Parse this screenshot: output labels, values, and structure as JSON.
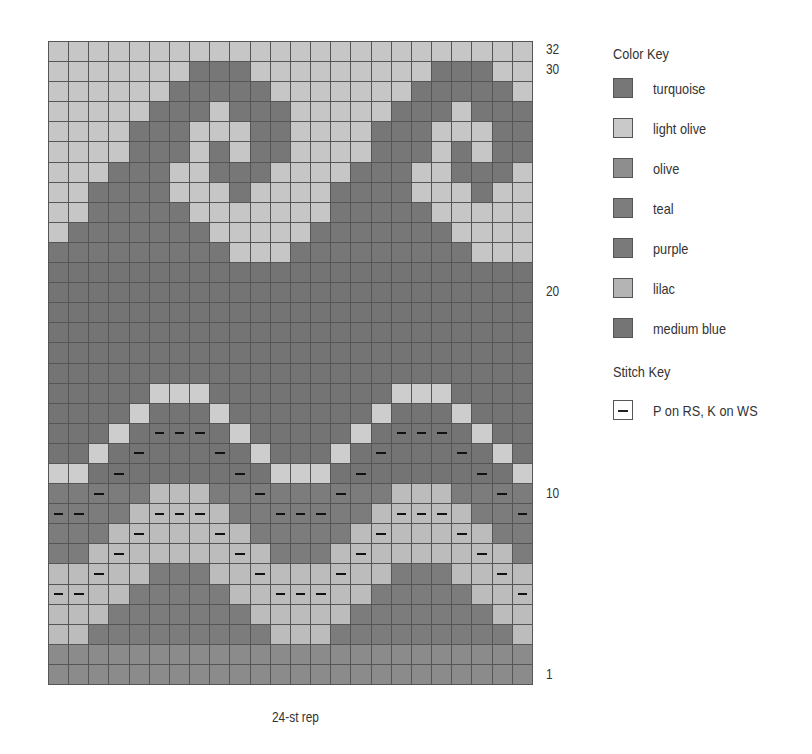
{
  "chart_data": {
    "type": "table",
    "columns": 24,
    "rows": 32,
    "repeat_label": "24-st rep",
    "row_labels": [
      {
        "row": 32,
        "text": "32"
      },
      {
        "row": 30,
        "text": "30"
      },
      {
        "row": 20,
        "text": "20"
      },
      {
        "row": 10,
        "text": "10"
      },
      {
        "row": 1,
        "text": "1"
      }
    ],
    "code_colors": {
      "L": "#c6c6c6",
      "T": "#777777",
      "B": "#747474",
      "C": "#cdcdcd",
      "O": "#bcbcbc",
      "P": "#7c7c7c",
      "M": "#8b8b8b"
    },
    "code_names": {
      "L": "light olive",
      "T": "turquoise",
      "B": "medium blue",
      "C": "lilac",
      "O": "olive",
      "P": "purple",
      "M": "teal"
    },
    "grid_rows_top_to_bottom": [
      {
        "row": 32,
        "cells": "LLLLLLLLLLLLLLLLLLLLLLLL",
        "dashes": "000000000000000000000000"
      },
      {
        "row": 31,
        "cells": "LLLLLLLTTTLLLLLLLLLTTTLL",
        "dashes": "000000000000000000000000"
      },
      {
        "row": 30,
        "cells": "LLLLLLTTTTTLLLLLLLTTTTTL",
        "dashes": "000000000000000000000000"
      },
      {
        "row": 29,
        "cells": "LLLLLTTTLTTTLLLLLTTTLTTT",
        "dashes": "000000000000000000000000"
      },
      {
        "row": 28,
        "cells": "LLLLTTTLLLTTLLLLTTTLLLTT",
        "dashes": "000000000000000000000000"
      },
      {
        "row": 27,
        "cells": "LLLLTTTLTLTTLLLLTTTLTLTT",
        "dashes": "000000000000000000000000"
      },
      {
        "row": 26,
        "cells": "LLLTTTLLTTTLLLLTTTLLTTTL",
        "dashes": "000000000000000000000000"
      },
      {
        "row": 25,
        "cells": "LLTTTTLLLTLLLLTTTTLLLTLL",
        "dashes": "000000000000000000000000"
      },
      {
        "row": 24,
        "cells": "LLTTTTTLLLLLLLTTTTTLLLLL",
        "dashes": "000000000000000000000000"
      },
      {
        "row": 23,
        "cells": "LTTTTTTTLLLLLTTTTTTTLLLL",
        "dashes": "000000000000000000000000"
      },
      {
        "row": 22,
        "cells": "TTTTTTTTTLLLTTTTTTTTTLLL",
        "dashes": "000000000000000000000000"
      },
      {
        "row": 21,
        "cells": "BBBBBBBBBBBBBBBBBBBBBBBB",
        "dashes": "000000000000000000000000"
      },
      {
        "row": 20,
        "cells": "BBBBBBBBBBBBBBBBBBBBBBBB",
        "dashes": "000000000000000000000000"
      },
      {
        "row": 19,
        "cells": "BBBBBBBBBBBBBBBBBBBBBBBB",
        "dashes": "000000000000000000000000"
      },
      {
        "row": 18,
        "cells": "BBBBBBBBBBBBBBBBBBBBBBBB",
        "dashes": "000000000000000000000000"
      },
      {
        "row": 17,
        "cells": "BBBBBBBBBBBBBBBBBBBBBBBB",
        "dashes": "000000000000000000000000"
      },
      {
        "row": 16,
        "cells": "BBBBBBBBBBBBBBBBBBBBBBBB",
        "dashes": "000000000000000000000000"
      },
      {
        "row": 15,
        "cells": "BBBBBCCCBBBBBBBBBCCCBBBB",
        "dashes": "000000000000000000000000"
      },
      {
        "row": 14,
        "cells": "BBBBCBBBCBBBBBBBCBBBCBBB",
        "dashes": "000000000000000000000000"
      },
      {
        "row": 13,
        "cells": "BBBCBBBBBCBBBBBCBBBBBCBB",
        "dashes": "000001110000000001110000"
      },
      {
        "row": 12,
        "cells": "BBCBBBBBBBCBBBCBBBBBBBCB",
        "dashes": "000010001000000010001000"
      },
      {
        "row": 11,
        "cells": "CCBBBBBBBBBCCCBBBBBBBBBC",
        "dashes": "000100000100000100000100"
      },
      {
        "row": 10,
        "cells": "PPPPPOOOPPPPPPPPPOOOPPPP",
        "dashes": "001000000010001000000010"
      },
      {
        "row": 9,
        "cells": "PPPPOOOOOPPPPPPPOOOOOPPP",
        "dashes": "110001110001110001110001"
      },
      {
        "row": 8,
        "cells": "PPPOOOOOOOPPPPPOOOOOOOPP",
        "dashes": "000010001000000010001000"
      },
      {
        "row": 7,
        "cells": "PPOOOOOOOOOPPPOOOOOOOOOP",
        "dashes": "000100000100000100000100"
      },
      {
        "row": 6,
        "cells": "OOOOOPPPOOOOOOOOOPPPOOOO",
        "dashes": "001000000010001000000010"
      },
      {
        "row": 5,
        "cells": "OOOOPPPPPOOOOOOOPPPPPOOO",
        "dashes": "110000000001110000000001"
      },
      {
        "row": 4,
        "cells": "OOOPPPPPPPOOOOOPPPPPPPOO",
        "dashes": "000000000000000000000000"
      },
      {
        "row": 3,
        "cells": "OOPPPPPPPPPOOOPPPPPPPPPO",
        "dashes": "000000000000000000000000"
      },
      {
        "row": 2,
        "cells": "MMMMMMMMMMMMMMMMMMMMMMMM",
        "dashes": "000000000000000000000000"
      },
      {
        "row": 1,
        "cells": "MMMMMMMMMMMMMMMMMMMMMMMM",
        "dashes": "000000000000000000000000"
      }
    ],
    "legend": {
      "color_key_title": "Color Key",
      "colors": [
        {
          "name": "turquoise",
          "swatch": "#777777"
        },
        {
          "name": "light olive",
          "swatch": "#c9c9c9"
        },
        {
          "name": "olive",
          "swatch": "#8e8e8e"
        },
        {
          "name": "teal",
          "swatch": "#7d7d7d"
        },
        {
          "name": "purple",
          "swatch": "#7a7a7a"
        },
        {
          "name": "lilac",
          "swatch": "#b4b4b4"
        },
        {
          "name": "medium blue",
          "swatch": "#757575"
        }
      ],
      "stitch_key_title": "Stitch Key",
      "stitches": [
        {
          "symbol": "dash",
          "name": "P on RS, K on WS"
        }
      ]
    }
  },
  "labels": {
    "row_32": "32",
    "row_30": "30",
    "row_20": "20",
    "row_10": "10",
    "row_1": "1",
    "repeat": "24-st rep",
    "color_key": "Color Key",
    "stitch_key": "Stitch Key",
    "colors": [
      "turquoise",
      "light olive",
      "olive",
      "teal",
      "purple",
      "lilac",
      "medium blue"
    ],
    "stitch_1": "P on RS, K on WS"
  }
}
